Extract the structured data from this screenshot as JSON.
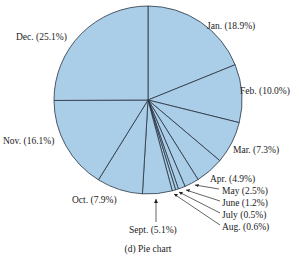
{
  "chart_data": {
    "type": "pie",
    "title": "",
    "caption": "(d) Pie chart",
    "start_angle": "12 o'clock, clockwise",
    "fill_color": "#aacde8",
    "edge_color": "#2a3440",
    "slices": [
      {
        "label": "Jan.",
        "value": 18.9,
        "text": "Jan. (18.9%)"
      },
      {
        "label": "Feb.",
        "value": 10.0,
        "text": "Feb. (10.0%)"
      },
      {
        "label": "Mar.",
        "value": 7.3,
        "text": "Mar. (7.3%)"
      },
      {
        "label": "Apr.",
        "value": 4.9,
        "text": "Apr. (4.9%)"
      },
      {
        "label": "May",
        "value": 2.5,
        "text": "May (2.5%)"
      },
      {
        "label": "June",
        "value": 1.2,
        "text": "June (1.2%)"
      },
      {
        "label": "July",
        "value": 0.5,
        "text": "July (0.5%)"
      },
      {
        "label": "Aug.",
        "value": 0.6,
        "text": "Aug. (0.6%)"
      },
      {
        "label": "Sept.",
        "value": 5.1,
        "text": "Sept. (5.1%)"
      },
      {
        "label": "Oct.",
        "value": 7.9,
        "text": "Oct. (7.9%)"
      },
      {
        "label": "Nov.",
        "value": 16.1,
        "text": "Nov. (16.1%)"
      },
      {
        "label": "Dec.",
        "value": 25.1,
        "text": "Dec. (25.1%)"
      }
    ],
    "categories": [
      "Jan.",
      "Feb.",
      "Mar.",
      "Apr.",
      "May",
      "June",
      "July",
      "Aug.",
      "Sept.",
      "Oct.",
      "Nov.",
      "Dec."
    ],
    "values": [
      18.9,
      10.0,
      7.3,
      4.9,
      2.5,
      1.2,
      0.5,
      0.6,
      5.1,
      7.9,
      16.1,
      25.1
    ],
    "legend": "none (labels placed outside slices)"
  }
}
